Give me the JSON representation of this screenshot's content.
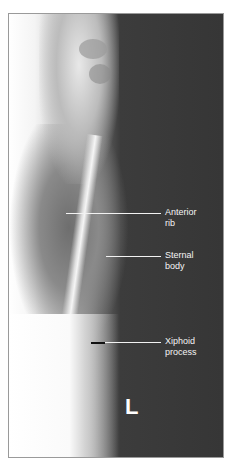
{
  "figure": {
    "labels": [
      {
        "id": "anterior-rib",
        "line1": "Anterior",
        "line2": "rib"
      },
      {
        "id": "sternal-body",
        "line1": "Sternal",
        "line2": "body"
      },
      {
        "id": "xiphoid-process",
        "line1": "Xiphoid",
        "line2": "process"
      }
    ],
    "side_marker": "L"
  }
}
